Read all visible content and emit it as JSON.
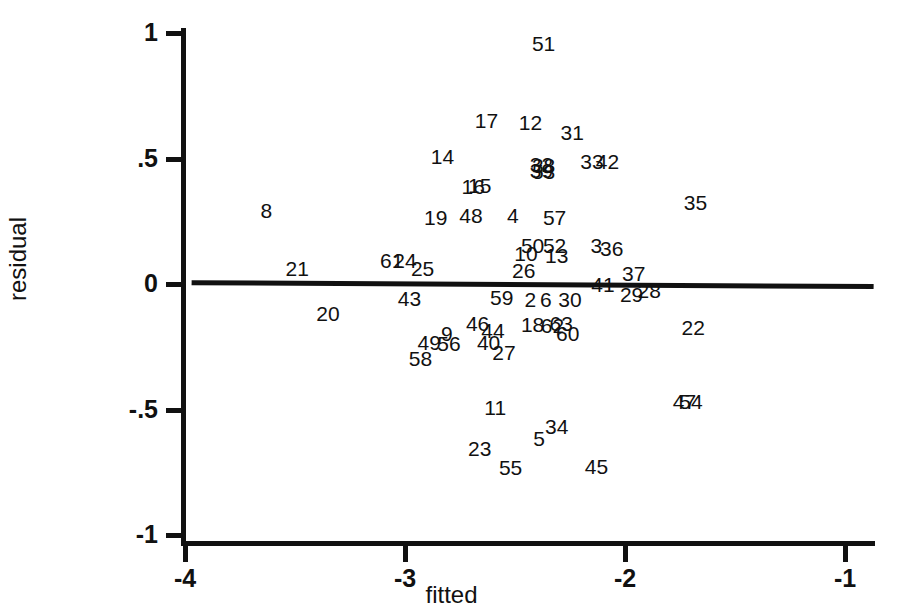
{
  "chart_data": {
    "type": "scatter",
    "title": "",
    "subtitle": "",
    "xlabel": "fitted",
    "ylabel": "residual",
    "xlim": [
      -4.0,
      -1.0
    ],
    "ylim": [
      -1.0,
      1.0
    ],
    "xticks": [
      -4,
      -3,
      -2,
      -1
    ],
    "xticklabels": [
      "-4",
      "-3",
      "-2",
      "-1"
    ],
    "yticks": [
      1,
      0.5,
      0,
      -0.5,
      -1
    ],
    "yticklabels": [
      "1",
      ".5",
      "0",
      "-.5",
      "-1"
    ],
    "grid": false,
    "legend": null,
    "marker_style": "observation-number-as-text-marker",
    "annotations": [
      {
        "type": "line",
        "name": "zero-reference-line",
        "x": [
          -3.97,
          -0.87
        ],
        "y": [
          0.005,
          -0.01
        ]
      }
    ],
    "points": [
      {
        "label": "51",
        "x": -2.37,
        "y": 0.96
      },
      {
        "label": "17",
        "x": -2.63,
        "y": 0.655
      },
      {
        "label": "12",
        "x": -2.43,
        "y": 0.645
      },
      {
        "label": "31",
        "x": -2.24,
        "y": 0.605
      },
      {
        "label": "14",
        "x": -2.83,
        "y": 0.51
      },
      {
        "label": "32",
        "x": -2.38,
        "y": 0.48
      },
      {
        "label": "38",
        "x": -2.37,
        "y": 0.475
      },
      {
        "label": "39",
        "x": -2.38,
        "y": 0.455
      },
      {
        "label": "53",
        "x": -2.37,
        "y": 0.45
      },
      {
        "label": "33",
        "x": -2.15,
        "y": 0.49
      },
      {
        "label": "42",
        "x": -2.08,
        "y": 0.49
      },
      {
        "label": "16",
        "x": -2.69,
        "y": 0.39
      },
      {
        "label": "15",
        "x": -2.66,
        "y": 0.395
      },
      {
        "label": "35",
        "x": -1.68,
        "y": 0.325
      },
      {
        "label": "8",
        "x": -3.63,
        "y": 0.295
      },
      {
        "label": "19",
        "x": -2.86,
        "y": 0.265
      },
      {
        "label": "48",
        "x": -2.7,
        "y": 0.275
      },
      {
        "label": "4",
        "x": -2.51,
        "y": 0.275
      },
      {
        "label": "57",
        "x": -2.32,
        "y": 0.265
      },
      {
        "label": "50",
        "x": -2.42,
        "y": 0.155
      },
      {
        "label": "52",
        "x": -2.32,
        "y": 0.155
      },
      {
        "label": "3",
        "x": -2.13,
        "y": 0.155
      },
      {
        "label": "36",
        "x": -2.06,
        "y": 0.145
      },
      {
        "label": "10",
        "x": -2.45,
        "y": 0.125
      },
      {
        "label": "13",
        "x": -2.31,
        "y": 0.115
      },
      {
        "label": "61",
        "x": -3.06,
        "y": 0.095
      },
      {
        "label": "24",
        "x": -3.0,
        "y": 0.095
      },
      {
        "label": "21",
        "x": -3.49,
        "y": 0.065
      },
      {
        "label": "25",
        "x": -2.92,
        "y": 0.065
      },
      {
        "label": "26",
        "x": -2.46,
        "y": 0.055
      },
      {
        "label": "37",
        "x": -1.96,
        "y": 0.045
      },
      {
        "label": "41",
        "x": -2.1,
        "y": 0.0
      },
      {
        "label": "28",
        "x": -1.89,
        "y": -0.025
      },
      {
        "label": "29",
        "x": -1.97,
        "y": -0.04
      },
      {
        "label": "43",
        "x": -2.98,
        "y": -0.055
      },
      {
        "label": "59",
        "x": -2.56,
        "y": -0.05
      },
      {
        "label": "2",
        "x": -2.43,
        "y": -0.06
      },
      {
        "label": "6",
        "x": -2.36,
        "y": -0.06
      },
      {
        "label": "30",
        "x": -2.25,
        "y": -0.06
      },
      {
        "label": "20",
        "x": -3.35,
        "y": -0.115
      },
      {
        "label": "46",
        "x": -2.67,
        "y": -0.155
      },
      {
        "label": "18",
        "x": -2.42,
        "y": -0.16
      },
      {
        "label": "62",
        "x": -2.33,
        "y": -0.165
      },
      {
        "label": "63",
        "x": -2.29,
        "y": -0.155
      },
      {
        "label": "22",
        "x": -1.69,
        "y": -0.17
      },
      {
        "label": "44",
        "x": -2.6,
        "y": -0.185
      },
      {
        "label": "60",
        "x": -2.26,
        "y": -0.195
      },
      {
        "label": "9",
        "x": -2.81,
        "y": -0.195
      },
      {
        "label": "49",
        "x": -2.89,
        "y": -0.23
      },
      {
        "label": "56",
        "x": -2.8,
        "y": -0.235
      },
      {
        "label": "40",
        "x": -2.62,
        "y": -0.23
      },
      {
        "label": "27",
        "x": -2.55,
        "y": -0.27
      },
      {
        "label": "58",
        "x": -2.93,
        "y": -0.295
      },
      {
        "label": "47",
        "x": -1.73,
        "y": -0.465
      },
      {
        "label": "54",
        "x": -1.7,
        "y": -0.465
      },
      {
        "label": "11",
        "x": -2.59,
        "y": -0.49
      },
      {
        "label": "34",
        "x": -2.31,
        "y": -0.565
      },
      {
        "label": "5",
        "x": -2.39,
        "y": -0.615
      },
      {
        "label": "23",
        "x": -2.66,
        "y": -0.655
      },
      {
        "label": "55",
        "x": -2.52,
        "y": -0.73
      },
      {
        "label": "45",
        "x": -2.13,
        "y": -0.725
      }
    ]
  }
}
